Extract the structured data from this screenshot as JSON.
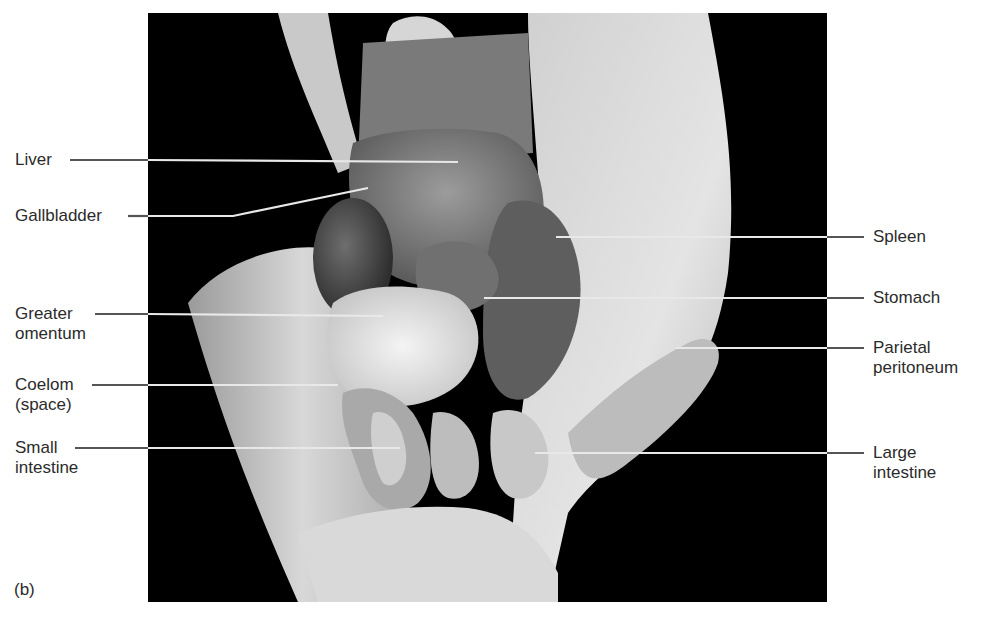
{
  "figure": {
    "panel_letter": "(b)",
    "photo_background": "#000000",
    "label_color": "#2b2b2b",
    "leader_color_outer": "#555555",
    "leader_color_inner": "#e8e8e8"
  },
  "labels": {
    "left": [
      {
        "id": "liver",
        "lines": [
          "Liver"
        ]
      },
      {
        "id": "gallbladder",
        "lines": [
          "Gallbladder"
        ]
      },
      {
        "id": "greater-omentum",
        "lines": [
          "Greater",
          "omentum"
        ]
      },
      {
        "id": "coelom",
        "lines": [
          "Coelom",
          "(space)"
        ]
      },
      {
        "id": "small-intestine",
        "lines": [
          "Small",
          "intestine"
        ]
      }
    ],
    "right": [
      {
        "id": "spleen",
        "lines": [
          "Spleen"
        ]
      },
      {
        "id": "stomach",
        "lines": [
          "Stomach"
        ]
      },
      {
        "id": "parietal-peritoneum",
        "lines": [
          "Parietal",
          "peritoneum"
        ]
      },
      {
        "id": "large-intestine",
        "lines": [
          "Large",
          "intestine"
        ]
      }
    ]
  }
}
